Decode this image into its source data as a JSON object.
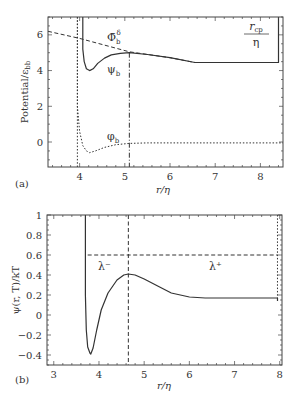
{
  "chart_data": [
    {
      "panel": "(a)",
      "type": "line",
      "xlabel": "r/η",
      "ylabel": "Potential/ε_bb",
      "xlim": [
        3.3,
        8.5
      ],
      "ylim": [
        -1.4,
        7.0
      ],
      "xticks": [
        4,
        5,
        6,
        7,
        8
      ],
      "yticks": [
        0,
        2,
        4,
        6
      ],
      "grid": false,
      "series": [
        {
          "name": "ψ_b",
          "style": "solid",
          "x": [
            4.07,
            4.07,
            4.1,
            4.15,
            4.22,
            4.3,
            4.4,
            4.55,
            4.7,
            4.9,
            5.1,
            5.5,
            6.0,
            6.55,
            8.4,
            8.4
          ],
          "y": [
            7.0,
            5.2,
            4.5,
            4.1,
            4.0,
            4.1,
            4.4,
            4.7,
            4.88,
            4.97,
            5.0,
            4.9,
            4.72,
            4.45,
            4.45,
            7.0
          ]
        },
        {
          "name": "Φ̄_b^δ",
          "style": "dashed",
          "x": [
            3.3,
            4.0,
            5.1,
            6.0,
            6.55
          ],
          "y": [
            6.2,
            5.8,
            5.05,
            4.72,
            4.45
          ]
        },
        {
          "name": "φ_b",
          "style": "dotted",
          "x": [
            3.95,
            3.95,
            4.0,
            4.07,
            4.15,
            4.22,
            4.35,
            4.55,
            4.8,
            5.1,
            5.5,
            6.5,
            8.5
          ],
          "y": [
            7.0,
            2.0,
            0.6,
            -0.2,
            -0.5,
            -0.6,
            -0.5,
            -0.3,
            -0.15,
            -0.08,
            -0.05,
            -0.05,
            -0.05
          ]
        }
      ],
      "vlines": [
        {
          "x": 3.95,
          "style": "dotted"
        },
        {
          "x": 5.1,
          "style": "dashdot",
          "from": -1.4,
          "to": 5.0
        }
      ],
      "annotations": [
        {
          "text": "Φ̄",
          "sup": "δ",
          "sub": "b",
          "x": 5.55,
          "y": 6.1
        },
        {
          "text": "ψ",
          "sub": "b",
          "x": 4.55,
          "y": 4.0
        },
        {
          "text": "φ",
          "sub": "b",
          "x": 4.65,
          "y": 0.3
        },
        {
          "text_num": "r",
          "num_sub": "cp",
          "den": "η",
          "x": 7.9,
          "y": 6.0
        }
      ]
    },
    {
      "panel": "(b)",
      "type": "line",
      "xlabel": "r/η",
      "ylabel": "ψ(r, T)/kT",
      "xlim": [
        2.85,
        8.05
      ],
      "ylim": [
        -0.5,
        1.0
      ],
      "xticks": [
        3,
        4,
        5,
        6,
        7,
        8
      ],
      "yticks": [
        -0.4,
        -0.2,
        0,
        0.2,
        0.4,
        0.6,
        0.8,
        1
      ],
      "grid": false,
      "series": [
        {
          "name": "ψ(r,T)/kT",
          "style": "solid",
          "x": [
            3.7,
            3.7,
            3.72,
            3.75,
            3.8,
            3.82,
            3.87,
            3.95,
            4.05,
            4.2,
            4.4,
            4.55,
            4.65,
            4.8,
            5.0,
            5.3,
            5.6,
            6.0,
            6.35,
            7.0,
            7.95,
            7.95
          ],
          "y": [
            1.0,
            0.2,
            -0.15,
            -0.32,
            -0.38,
            -0.39,
            -0.33,
            -0.15,
            0.05,
            0.22,
            0.35,
            0.4,
            0.41,
            0.4,
            0.36,
            0.29,
            0.22,
            0.18,
            0.17,
            0.17,
            0.17,
            0.14
          ]
        }
      ],
      "hlines": [
        {
          "y": 0.6,
          "from": 3.75,
          "to": 7.95,
          "style": "dashed"
        }
      ],
      "vlines": [
        {
          "x": 4.65,
          "style": "dashed",
          "from": -0.5,
          "to": 1.0
        },
        {
          "x": 7.95,
          "style": "dotted",
          "from": 0.14,
          "to": 1.0
        }
      ],
      "annotations": [
        {
          "text": "λ⁻",
          "x": 4.05,
          "y": 0.49
        },
        {
          "text": "λ⁺",
          "x": 6.6,
          "y": 0.49
        }
      ]
    }
  ],
  "labels": {
    "panel_a": "(a)",
    "panel_b": "(b)",
    "xlabel_a": "r/η",
    "xlabel_b": "r/η",
    "ylabel_a": "Potential/ε",
    "ylabel_a_sub": "bb",
    "ylabel_b": "ψ(r, T)/kT",
    "anno_phibar": "Φ̄",
    "anno_phibar_sup": "δ",
    "anno_sub_b": "b",
    "anno_psi": "ψ",
    "anno_phi": "φ",
    "anno_rcp_num": "r",
    "anno_rcp_sub": "cp",
    "anno_rcp_den": "η",
    "anno_lambda_minus": "λ⁻",
    "anno_lambda_plus": "λ⁺"
  }
}
